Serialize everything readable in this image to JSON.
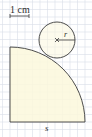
{
  "diagram": {
    "scale_label": "1 cm",
    "radius_label": "r",
    "side_label": "s",
    "shapes": {
      "quarter_circle": {
        "label": "s"
      },
      "small_circle": {
        "label": "r"
      }
    },
    "colors": {
      "grid": "#d6dbe6",
      "fill": "#fbf8dc",
      "stroke": "#3a3a3a"
    }
  }
}
